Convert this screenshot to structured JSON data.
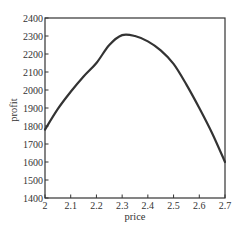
{
  "chart_data": {
    "type": "line",
    "title": "",
    "xlabel": "price",
    "ylabel": "profit",
    "xlim": [
      2.0,
      2.7
    ],
    "ylim": [
      1400,
      2400
    ],
    "xticks": [
      2,
      2.1,
      2.2,
      2.3,
      2.4,
      2.5,
      2.6,
      2.7
    ],
    "xtick_labels": [
      "2",
      "2.1",
      "2.2",
      "2.3",
      "2.4",
      "2.5",
      "2.6",
      "2.7"
    ],
    "yticks": [
      1400,
      1500,
      1600,
      1700,
      1800,
      1900,
      2000,
      2100,
      2200,
      2300,
      2400
    ],
    "ytick_labels": [
      "1400",
      "1500",
      "1600",
      "1700",
      "1800",
      "1900",
      "2000",
      "2100",
      "2200",
      "2300",
      "2400"
    ],
    "grid": false,
    "legend": null,
    "series": [
      {
        "name": "profit",
        "color": "#333333",
        "x": [
          2.0,
          2.05,
          2.1,
          2.15,
          2.2,
          2.25,
          2.3,
          2.35,
          2.4,
          2.45,
          2.5,
          2.55,
          2.6,
          2.65,
          2.7
        ],
        "y": [
          1780,
          1895,
          1990,
          2075,
          2150,
          2250,
          2305,
          2300,
          2270,
          2220,
          2145,
          2030,
          1900,
          1760,
          1600
        ]
      }
    ]
  },
  "plot_area": {
    "left": 45,
    "top": 18,
    "right": 225,
    "bottom": 198
  }
}
